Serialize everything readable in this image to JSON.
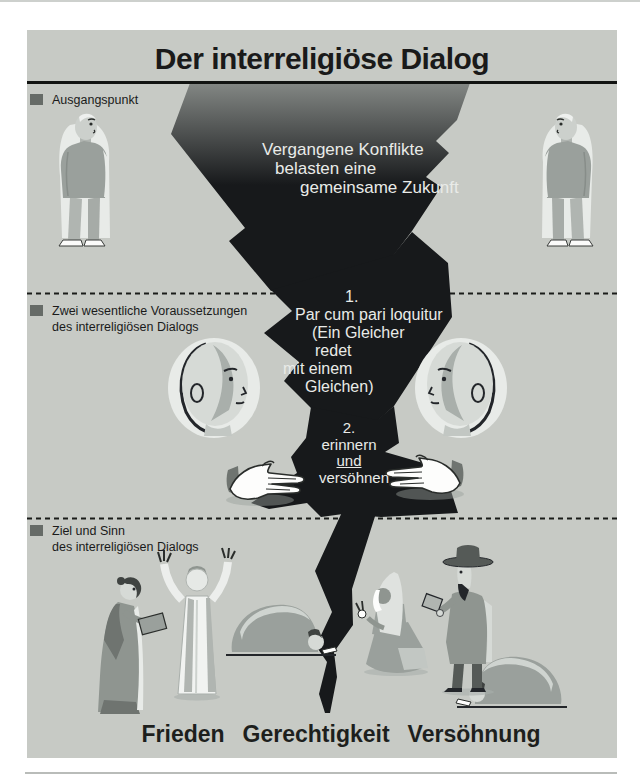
{
  "header": {
    "title": "Der interreligiöse Dialog"
  },
  "sections": {
    "one": {
      "label": "Ausgangspunkt"
    },
    "two": {
      "label_line1": "Zwei wesentliche Voraussetzungen",
      "label_line2": "des interreligiösen Dialogs"
    },
    "three": {
      "label_line1": "Ziel und Sinn",
      "label_line2": "des interreligiösen Dialogs"
    }
  },
  "crack_text": {
    "statement": {
      "line1": "Vergangene Konflikte",
      "line2": "belasten eine",
      "line3": "gemeinsame Zukunft"
    },
    "premise1": {
      "number": "1.",
      "line1": "Par cum pari loquitur",
      "line2": "(Ein Gleicher",
      "line3": "redet",
      "line4": "mit einem",
      "line5": "Gleichen)"
    },
    "premise2": {
      "number": "2.",
      "line1": "erinnern",
      "line2": "und",
      "line3": "versöhnen"
    }
  },
  "footer": {
    "word1": "Frieden",
    "word2": "Gerechtigkeit",
    "word3": "Versöhnung"
  },
  "figures": [
    "standing-person-left",
    "standing-person-right",
    "head-profile-left",
    "head-profile-right",
    "reaching-hand-left",
    "reaching-hand-right",
    "woman-with-book",
    "priest-arms-raised",
    "prostrating-person-left",
    "kneeling-nun",
    "man-with-hat-and-book",
    "prostrating-person-right"
  ],
  "colors": {
    "panel_bg": "#c7cac5",
    "crack": "#17191b",
    "crack_top": "#838784",
    "accent_square": "#666b67",
    "text_dark": "#1a1a1a",
    "text_light": "#e9ebe8"
  }
}
